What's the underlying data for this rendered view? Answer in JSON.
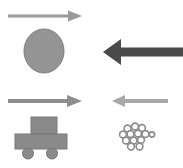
{
  "figure": {
    "title": "Force and motion comparison panels",
    "width": 183,
    "height": 168,
    "background_color": "#ffffff"
  },
  "colors": {
    "arrow_thin_light": "#9a9a9a",
    "arrow_thick_dark": "#4a4a4a",
    "arrow_medium_gray": "#8e8e8e",
    "arrow_pale_gray": "#a8a8a8",
    "ellipse_fill": "#949494",
    "ellipse_stroke": "#7e7e7e",
    "cart_fill": "#8a8a8a",
    "cart_stroke": "#787878",
    "bead_stroke": "#8c8c8c",
    "bead_fill": "#ffffff"
  },
  "panels": [
    {
      "id": "top-left",
      "name": "ellipse-with-thin-right-arrow",
      "arrow": {
        "name": "thin-right-arrow",
        "direction": "right",
        "magnitude": "small",
        "color": "#9a9a9a",
        "shaft_thickness_px": 3,
        "length_px": 72
      },
      "object": {
        "name": "gray-ellipse",
        "shape": "ellipse",
        "label": "ball",
        "fill": "#949494",
        "width_px": 40,
        "height_px": 44
      }
    },
    {
      "id": "top-right",
      "name": "thick-left-arrow-only",
      "arrow": {
        "name": "thick-left-arrow",
        "direction": "left",
        "magnitude": "large",
        "color": "#4a4a4a",
        "shaft_thickness_px": 9,
        "length_px": 80
      },
      "object": null
    },
    {
      "id": "bottom-left",
      "name": "cart-with-medium-right-arrow",
      "arrow": {
        "name": "medium-right-arrow",
        "direction": "right",
        "magnitude": "medium",
        "color": "#8e8e8e",
        "shaft_thickness_px": 5,
        "length_px": 72
      },
      "object": {
        "name": "wheeled-cart",
        "shape": "cart",
        "label": "cart",
        "fill": "#8a8a8a",
        "wheel_count": 2
      }
    },
    {
      "id": "bottom-right",
      "name": "beads-with-pale-left-arrow",
      "arrow": {
        "name": "pale-left-arrow",
        "direction": "left",
        "magnitude": "small",
        "color": "#a8a8a8",
        "shaft_thickness_px": 4,
        "length_px": 60
      },
      "object": {
        "name": "bead-cluster",
        "shape": "circle-cluster",
        "label": "beads",
        "stroke": "#8c8c8c",
        "bead_count": 13,
        "beads": [
          {
            "cx": 127.5,
            "cy": 128.5,
            "r": 3.4
          },
          {
            "cx": 135.0,
            "cy": 126.5,
            "r": 3.4
          },
          {
            "cx": 142.0,
            "cy": 128.0,
            "r": 3.4
          },
          {
            "cx": 123.0,
            "cy": 134.5,
            "r": 3.4
          },
          {
            "cx": 130.5,
            "cy": 134.0,
            "r": 3.4
          },
          {
            "cx": 138.0,
            "cy": 133.5,
            "r": 3.4
          },
          {
            "cx": 145.5,
            "cy": 134.0,
            "r": 3.4
          },
          {
            "cx": 152.0,
            "cy": 134.5,
            "r": 2.6
          },
          {
            "cx": 126.0,
            "cy": 140.5,
            "r": 3.4
          },
          {
            "cx": 133.5,
            "cy": 140.5,
            "r": 3.4
          },
          {
            "cx": 141.0,
            "cy": 140.0,
            "r": 3.4
          },
          {
            "cx": 131.0,
            "cy": 146.5,
            "r": 3.4
          },
          {
            "cx": 139.5,
            "cy": 146.5,
            "r": 3.4
          }
        ]
      }
    }
  ]
}
